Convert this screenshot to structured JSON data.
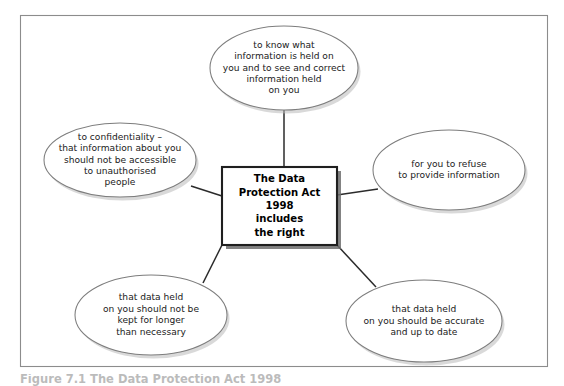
{
  "figure": {
    "caption": "Figure 7.1 The Data Protection Act 1998",
    "frame": {
      "x": 20,
      "y": 15,
      "width": 528,
      "height": 352,
      "border_color": "#8c8c8c",
      "background_color": "#ffffff"
    }
  },
  "center_node": {
    "name": "data-protection-act-box",
    "shape": "rectangle",
    "x": 222,
    "y": 167,
    "width": 115,
    "height": 78,
    "border_color": "#1f1f1f",
    "fill_color": "#ffffff",
    "lines": [
      "The Data",
      "Protection Act",
      "1998",
      "includes",
      "the right"
    ]
  },
  "branches": [
    {
      "id": "top",
      "name": "right-to-know-information",
      "shape": "ellipse",
      "cx": 284,
      "cy": 68,
      "rx": 74,
      "ry": 42,
      "border_color": "#7d7d7d",
      "fill_color": "#ffffff",
      "lines": [
        "to know what",
        "information is held on",
        "you and to see and correct",
        "information held",
        "on you"
      ],
      "connector": {
        "x1": 284,
        "y1": 110,
        "x2": 284,
        "y2": 167
      }
    },
    {
      "id": "left",
      "name": "right-to-confidentiality",
      "shape": "ellipse",
      "cx": 120,
      "cy": 160,
      "rx": 76,
      "ry": 37,
      "border_color": "#7d7d7d",
      "fill_color": "#ffffff",
      "lines": [
        "to confidentiality –",
        "that information about you",
        "should not be accessible",
        "to unauthorised",
        "people"
      ],
      "connector": {
        "x1": 191,
        "y1": 186,
        "x2": 222,
        "y2": 196
      }
    },
    {
      "id": "right",
      "name": "right-to-refuse-to-provide-information",
      "shape": "ellipse",
      "cx": 449,
      "cy": 170,
      "rx": 76,
      "ry": 40,
      "border_color": "#7d7d7d",
      "fill_color": "#ffffff",
      "lines": [
        "for you to refuse",
        "to provide information"
      ],
      "connector": {
        "x1": 337,
        "y1": 195,
        "x2": 378,
        "y2": 189
      }
    },
    {
      "id": "bottom-left",
      "name": "right-to-data-retention-limit",
      "shape": "ellipse",
      "cx": 151,
      "cy": 315,
      "rx": 76,
      "ry": 40,
      "border_color": "#7d7d7d",
      "fill_color": "#ffffff",
      "lines": [
        "that data held",
        "on you should not be",
        "kept for longer",
        "than necessary"
      ],
      "connector": {
        "x1": 222,
        "y1": 245,
        "x2": 203,
        "y2": 283
      }
    },
    {
      "id": "bottom-right",
      "name": "right-to-accurate-data",
      "shape": "ellipse",
      "cx": 424,
      "cy": 321,
      "rx": 78,
      "ry": 41,
      "border_color": "#7d7d7d",
      "fill_color": "#ffffff",
      "lines": [
        "that data held",
        "on you should be accurate",
        "and up to date"
      ],
      "connector": {
        "x1": 337,
        "y1": 245,
        "x2": 376,
        "y2": 287
      }
    }
  ]
}
